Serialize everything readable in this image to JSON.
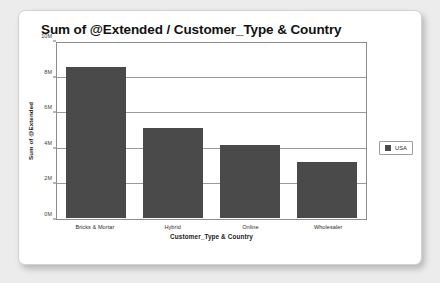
{
  "chart_data": {
    "type": "bar",
    "title": "Sum of @Extended / Customer_Type & Country",
    "xlabel": "Customer_Type & Country",
    "ylabel": "Sum of @Extended",
    "categories": [
      "Bricks & Mortar",
      "Hybrid",
      "Online",
      "Wholesaler"
    ],
    "series": [
      {
        "name": "USA",
        "color": "#4a4a4a",
        "values": [
          8700000,
          5200000,
          4200000,
          3200000
        ]
      }
    ],
    "ylim": [
      0,
      10000000
    ],
    "ytick_values": [
      0,
      2000000,
      4000000,
      6000000,
      8000000,
      10000000
    ],
    "ytick_labels": [
      "0M",
      "2M",
      "4M",
      "6M",
      "8M",
      "10M"
    ],
    "grid": true,
    "legend_position": "right",
    "legend_entries": [
      {
        "label": "USA",
        "color": "#4a4a4a"
      }
    ]
  }
}
